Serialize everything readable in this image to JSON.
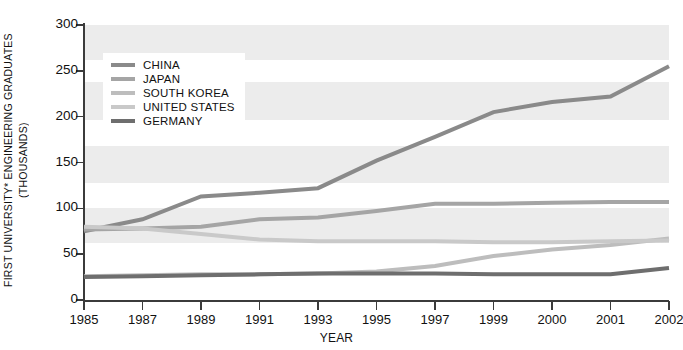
{
  "chart_data": {
    "type": "line",
    "title": "",
    "xlabel": "YEAR",
    "ylabel_line1": "FIRST UNIVERSITY* ENGINEERING GRADUATES",
    "ylabel_line2": "(THOUSANDS)",
    "categories": [
      "1985",
      "1987",
      "1989",
      "1991",
      "1993",
      "1995",
      "1997",
      "1999",
      "2000",
      "2001",
      "2002"
    ],
    "ylim": [
      0,
      300
    ],
    "yticks": [
      0,
      50,
      100,
      150,
      200,
      250,
      300
    ],
    "grid": false,
    "background_bands": true,
    "legend_position": "top-left inside",
    "series": [
      {
        "name": "CHINA",
        "color": "#8a8a8a",
        "width": 4.0,
        "values": [
          75,
          88,
          113,
          117,
          122,
          152,
          178,
          205,
          216,
          222,
          255
        ]
      },
      {
        "name": "JAPAN",
        "color": "#a5a5a5",
        "width": 4.0,
        "values": [
          77,
          78,
          80,
          88,
          90,
          97,
          105,
          105,
          106,
          107,
          107
        ]
      },
      {
        "name": "SOUTH KOREA",
        "color": "#bdbdbd",
        "width": 4.0,
        "values": [
          26,
          27,
          28,
          28,
          29,
          31,
          37,
          48,
          55,
          60,
          67
        ]
      },
      {
        "name": "UNITED STATES",
        "color": "#c9c9c9",
        "width": 4.0,
        "values": [
          80,
          78,
          72,
          66,
          64,
          64,
          64,
          63,
          63,
          64,
          65
        ]
      },
      {
        "name": "GERMANY",
        "color": "#6e6e6e",
        "width": 4.0,
        "values": [
          25,
          26,
          27,
          28,
          29,
          29,
          29,
          28,
          28,
          28,
          35
        ]
      }
    ]
  },
  "axis": {
    "y_tick_labels": [
      "300",
      "250",
      "200",
      "150",
      "100",
      "50",
      "0"
    ],
    "x_tick_labels": [
      "1985",
      "1987",
      "1989",
      "1991",
      "1993",
      "1995",
      "1997",
      "1999",
      "2000",
      "2001",
      "2002"
    ],
    "x_title": "YEAR"
  },
  "legend": {
    "items": [
      {
        "label": "CHINA",
        "color": "#8a8a8a"
      },
      {
        "label": "JAPAN",
        "color": "#a5a5a5"
      },
      {
        "label": "SOUTH KOREA",
        "color": "#bdbdbd"
      },
      {
        "label": "UNITED STATES",
        "color": "#c9c9c9"
      },
      {
        "label": "GERMANY",
        "color": "#6e6e6e"
      }
    ]
  },
  "style": {
    "band_color": "#ececec",
    "axis_color": "#3b3b3b",
    "text_color": "#111111",
    "plot_background": "#ffffff"
  }
}
